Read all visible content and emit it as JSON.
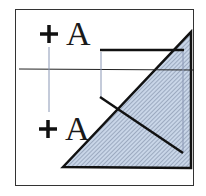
{
  "diagram": {
    "labels": {
      "top": "A",
      "bottom": "A"
    },
    "colors": {
      "stroke": "#111111",
      "hatch_fill": "#c9d6e8",
      "hatch_line": "#6f7f99",
      "guide_line": "#8a97b5",
      "frame": "#333333"
    }
  }
}
